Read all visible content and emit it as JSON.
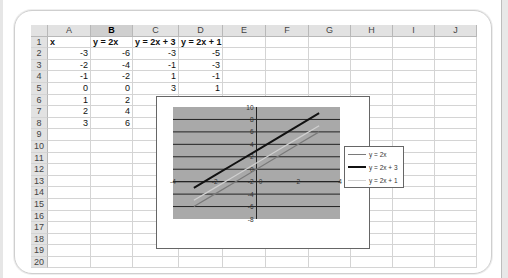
{
  "spreadsheet": {
    "columns": [
      "A",
      "B",
      "C",
      "D",
      "E",
      "F",
      "G",
      "H",
      "I",
      "J"
    ],
    "selected_column": "B",
    "column_widths": [
      43,
      42,
      46,
      44,
      43,
      43,
      42,
      42,
      42,
      42
    ],
    "rows": [
      {
        "n": "1",
        "cells": [
          "x",
          "y = 2x",
          "y = 2x + 3",
          "y = 2x + 1",
          "",
          "",
          "",
          "",
          "",
          ""
        ]
      },
      {
        "n": "2",
        "cells": [
          "-3",
          "-6",
          "-3",
          "-5",
          "",
          "",
          "",
          "",
          "",
          ""
        ]
      },
      {
        "n": "3",
        "cells": [
          "-2",
          "-4",
          "-1",
          "-3",
          "",
          "",
          "",
          "",
          "",
          ""
        ]
      },
      {
        "n": "4",
        "cells": [
          "-1",
          "-2",
          "1",
          "-1",
          "",
          "",
          "",
          "",
          "",
          ""
        ]
      },
      {
        "n": "5",
        "cells": [
          "0",
          "0",
          "3",
          "1",
          "",
          "",
          "",
          "",
          "",
          ""
        ]
      },
      {
        "n": "6",
        "cells": [
          "1",
          "2",
          "",
          "",
          "",
          "",
          "",
          "",
          "",
          ""
        ]
      },
      {
        "n": "7",
        "cells": [
          "2",
          "4",
          "",
          "",
          "",
          "",
          "",
          "",
          "",
          ""
        ]
      },
      {
        "n": "8",
        "cells": [
          "3",
          "6",
          "",
          "",
          "",
          "",
          "",
          "",
          "",
          ""
        ]
      },
      {
        "n": "9",
        "cells": [
          "",
          "",
          "",
          "",
          "",
          "",
          "",
          "",
          "",
          ""
        ]
      },
      {
        "n": "10",
        "cells": [
          "",
          "",
          "",
          "",
          "",
          "",
          "",
          "",
          "",
          ""
        ]
      },
      {
        "n": "11",
        "cells": [
          "",
          "",
          "",
          "",
          "",
          "",
          "",
          "",
          "",
          ""
        ]
      },
      {
        "n": "12",
        "cells": [
          "",
          "",
          "",
          "",
          "",
          "",
          "",
          "",
          "",
          ""
        ]
      },
      {
        "n": "13",
        "cells": [
          "",
          "",
          "",
          "",
          "",
          "",
          "",
          "",
          "",
          ""
        ]
      },
      {
        "n": "14",
        "cells": [
          "",
          "",
          "",
          "",
          "",
          "",
          "",
          "",
          "",
          ""
        ]
      },
      {
        "n": "15",
        "cells": [
          "",
          "",
          "",
          "",
          "",
          "",
          "",
          "",
          "",
          ""
        ]
      },
      {
        "n": "16",
        "cells": [
          "",
          "",
          "",
          "",
          "",
          "",
          "",
          "",
          "",
          ""
        ]
      },
      {
        "n": "17",
        "cells": [
          "",
          "",
          "",
          "",
          "",
          "",
          "",
          "",
          "",
          ""
        ]
      },
      {
        "n": "18",
        "cells": [
          "",
          "",
          "",
          "",
          "",
          "",
          "",
          "",
          "",
          ""
        ]
      },
      {
        "n": "19",
        "cells": [
          "",
          "",
          "",
          "",
          "",
          "",
          "",
          "",
          "",
          ""
        ]
      },
      {
        "n": "20",
        "cells": [
          "",
          "",
          "",
          "",
          "",
          "",
          "",
          "",
          "",
          ""
        ]
      }
    ]
  },
  "chart": {
    "plot_bg": "#a9a9a9",
    "legend": [
      {
        "label": "y = 2x",
        "color": "#7a7a7a",
        "width": 1.2
      },
      {
        "label": "y = 2x + 3",
        "color": "#111111",
        "width": 2
      },
      {
        "label": "y = 2x + 1",
        "color": "#d0d0d0",
        "width": 1.2
      }
    ]
  },
  "chart_data": {
    "type": "line",
    "title": "",
    "xlabel": "",
    "ylabel": "",
    "x": [
      -3,
      -2,
      -1,
      0,
      1,
      2,
      3
    ],
    "series": [
      {
        "name": "y = 2x",
        "values": [
          -6,
          -4,
          -2,
          0,
          2,
          4,
          6
        ]
      },
      {
        "name": "y = 2x + 3",
        "values": [
          -3,
          -1,
          1,
          3,
          5,
          7,
          9
        ]
      },
      {
        "name": "y = 2x + 1",
        "values": [
          -5,
          -3,
          -1,
          1,
          3,
          5,
          7
        ]
      }
    ],
    "xlim": [
      -4,
      4
    ],
    "ylim": [
      -8,
      10
    ],
    "x_ticks": [
      "-4",
      "-2",
      "0",
      "2",
      "4"
    ],
    "y_ticks": [
      "10",
      "8",
      "6",
      "4",
      "2",
      "0",
      "-2",
      "-4",
      "-6",
      "-8"
    ],
    "grid": true,
    "legend_position": "right"
  }
}
